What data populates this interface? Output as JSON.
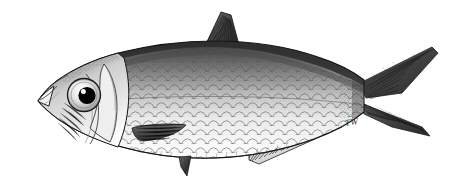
{
  "image": {
    "kind": "scientific-illustration",
    "medium": "pen-and-ink stipple and line drawing",
    "subject": "herring-like fish, lateral view, facing left",
    "family_appearance": "Clupeidae (herring / shad / sardine)",
    "background_color": "#ffffff",
    "border_color": "#9a9a9a",
    "ink_color": "#1d1d1d",
    "signature": "TW",
    "caption": ""
  },
  "palette": {
    "paper": "#ffffff",
    "frame": "#9a9a9a",
    "ink_dark": "#1d1d1d",
    "ink_mid": "#4f4f4f",
    "ink_light": "#8c8c8c",
    "scale_line": "#6e6e6e",
    "belly": "#fcfcfc",
    "pupil": "#000000",
    "eye_ring": "#2a2a2a",
    "fin_dark": "#3a3a3a"
  },
  "anatomy": {
    "parts": [
      {
        "name": "snout",
        "label": "Snout / upturned mouth"
      },
      {
        "name": "eye",
        "label": "Eye"
      },
      {
        "name": "pupil",
        "label": "Pupil"
      },
      {
        "name": "operculum",
        "label": "Operculum (gill cover)"
      },
      {
        "name": "preopercle",
        "label": "Preopercle"
      },
      {
        "name": "body",
        "label": "Body with cycloid scales"
      },
      {
        "name": "lateral-midline",
        "label": "Lateral midline"
      },
      {
        "name": "dorsal-fin",
        "label": "Dorsal fin"
      },
      {
        "name": "pectoral-fin",
        "label": "Pectoral fin"
      },
      {
        "name": "pelvic-fin",
        "label": "Pelvic fin"
      },
      {
        "name": "anal-fin",
        "label": "Anal fin"
      },
      {
        "name": "caudal-peduncle",
        "label": "Caudal peduncle"
      },
      {
        "name": "caudal-fin",
        "label": "Caudal fin (deeply forked)"
      }
    ]
  },
  "geometry": {
    "canvas": {
      "width": 465,
      "height": 188
    },
    "frame": {
      "x": 5,
      "y": 5,
      "width": 453,
      "height": 176
    },
    "signature_position": {
      "x": 345,
      "y": 117
    },
    "body_outline": "M 38,101 C 44,92 50,86 58,80 C 72,70 92,60 118,53 C 150,45 186,41 214,41 C 248,41 286,46 318,57 C 340,64 354,72 364,80 L 364,112 C 352,122 336,131 314,139 C 284,150 248,157 214,158 C 182,159 150,155 122,147 C 96,140 74,130 58,119 C 50,113 43,107 38,101 Z",
    "dorsal_fin": "M 205,42 L 222,13 L 232,16 L 238,44 L 233,50 Z",
    "caudal_fin_upper": "M 364,82 L 430,48 L 436,52 L 400,92 L 372,96 Z",
    "caudal_fin_lower": "M 366,104 L 420,128 L 428,135 L 392,126 L 370,112 Z",
    "anal_fin": "M 250,150 L 336,122 L 340,127 L 258,162 L 250,159 Z",
    "pectoral_fin": "M 134,129 L 186,126 L 182,136 L 146,141 Z",
    "pelvic_fin": "M 180,158 L 190,157 L 186,174 L 180,166 Z",
    "eye": {
      "cx": 84,
      "cy": 95,
      "rx": 16,
      "ry": 16
    },
    "pupil": {
      "cx": 87,
      "cy": 95,
      "r": 8.5
    }
  },
  "render": {
    "scale_rows": 15,
    "scale_cols": 30,
    "stipple_density": "dense along dorsum, fading to blank ventrum",
    "fin_ray_counts": {
      "dorsal": 18,
      "anal": 22,
      "caudal_upper": 16,
      "caudal_lower": 14,
      "pectoral": 10
    }
  }
}
